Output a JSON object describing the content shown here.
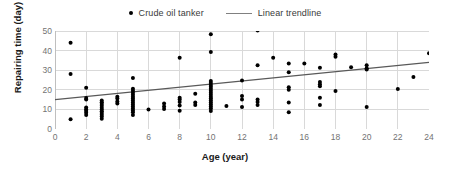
{
  "chart_data": {
    "type": "scatter",
    "title": "",
    "xlabel": "Age (year)",
    "ylabel": "Repairing time (day)",
    "xlim": [
      0,
      24
    ],
    "ylim": [
      0,
      50
    ],
    "xticks": [
      0,
      2,
      4,
      6,
      8,
      10,
      12,
      14,
      16,
      18,
      20,
      22,
      24
    ],
    "yticks": [
      0,
      10,
      20,
      30,
      40,
      50
    ],
    "grid": true,
    "legend_position": "top-center",
    "colors": {
      "marker": "#000000",
      "trendline": "#595959",
      "grid": "#d9d9d9",
      "tick_text": "#737373",
      "axis_title": "#1a1a1a"
    },
    "series": [
      {
        "name": "Crude oil tanker",
        "type": "scatter",
        "marker": "circle",
        "color": "#000000",
        "points": [
          [
            1,
            44.0
          ],
          [
            1,
            28.0
          ],
          [
            1,
            5.0
          ],
          [
            2,
            21.0
          ],
          [
            2,
            15.8
          ],
          [
            2,
            15.0
          ],
          [
            2,
            11.0
          ],
          [
            2,
            10.0
          ],
          [
            2,
            9.2
          ],
          [
            2,
            8.3
          ],
          [
            2,
            7.2
          ],
          [
            3,
            14.5
          ],
          [
            3,
            13.6
          ],
          [
            3,
            12.7
          ],
          [
            3,
            11.8
          ],
          [
            3,
            10.9
          ],
          [
            3,
            10.0
          ],
          [
            3,
            9.1
          ],
          [
            3,
            8.2
          ],
          [
            3,
            7.3
          ],
          [
            3,
            6.4
          ],
          [
            3,
            5.2
          ],
          [
            4,
            16.5
          ],
          [
            4,
            15.5
          ],
          [
            4,
            14.0
          ],
          [
            4,
            13.0
          ],
          [
            5,
            26.0
          ],
          [
            5,
            20.5
          ],
          [
            5,
            19.5
          ],
          [
            5,
            18.5
          ],
          [
            5,
            17.5
          ],
          [
            5,
            16.5
          ],
          [
            5,
            15.5
          ],
          [
            5,
            14.5
          ],
          [
            5,
            13.5
          ],
          [
            5,
            12.5
          ],
          [
            5,
            11.5
          ],
          [
            5,
            10.5
          ],
          [
            5,
            9.5
          ],
          [
            5,
            8.5
          ],
          [
            5,
            7.2
          ],
          [
            6,
            10.0
          ],
          [
            7,
            13.0
          ],
          [
            7,
            11.5
          ],
          [
            7,
            10.2
          ],
          [
            8,
            36.3
          ],
          [
            8,
            16.0
          ],
          [
            8,
            15.0
          ],
          [
            8,
            13.8
          ],
          [
            8,
            12.0
          ],
          [
            8,
            9.3
          ],
          [
            9,
            18.0
          ],
          [
            9,
            13.5
          ],
          [
            9,
            12.2
          ],
          [
            10,
            48.3
          ],
          [
            10,
            39.3
          ],
          [
            10,
            24.5
          ],
          [
            10,
            23.5
          ],
          [
            10,
            22.5
          ],
          [
            10,
            21.5
          ],
          [
            10,
            20.5
          ],
          [
            10,
            19.5
          ],
          [
            10,
            18.5
          ],
          [
            10,
            17.5
          ],
          [
            10,
            16.5
          ],
          [
            10,
            15.5
          ],
          [
            10,
            14.5
          ],
          [
            10,
            13.5
          ],
          [
            10,
            12.5
          ],
          [
            10,
            11.5
          ],
          [
            10,
            10.5
          ],
          [
            10,
            9.2
          ],
          [
            11,
            11.7
          ],
          [
            12,
            24.8
          ],
          [
            12,
            16.8
          ],
          [
            12,
            15.0
          ],
          [
            12,
            11.2
          ],
          [
            13,
            50.3
          ],
          [
            13,
            32.5
          ],
          [
            13,
            15.0
          ],
          [
            13,
            13.8
          ],
          [
            13,
            12.3
          ],
          [
            14,
            36.4
          ],
          [
            15,
            33.4
          ],
          [
            15,
            29.0
          ],
          [
            15,
            21.3
          ],
          [
            15,
            20.0
          ],
          [
            15,
            13.5
          ],
          [
            15,
            8.5
          ],
          [
            16,
            33.4
          ],
          [
            17,
            31.3
          ],
          [
            17,
            24.0
          ],
          [
            17,
            22.8
          ],
          [
            17,
            21.8
          ],
          [
            17,
            16.0
          ],
          [
            17,
            12.2
          ],
          [
            18,
            38.0
          ],
          [
            18,
            36.8
          ],
          [
            18,
            19.4
          ],
          [
            19,
            31.5
          ],
          [
            20,
            32.5
          ],
          [
            20,
            31.0
          ],
          [
            20,
            30.3
          ],
          [
            20,
            11.2
          ],
          [
            22,
            20.4
          ],
          [
            23,
            26.5
          ],
          [
            24,
            38.6
          ]
        ]
      },
      {
        "name": "Linear trendline",
        "type": "line",
        "color": "#595959",
        "x_start": 0,
        "y_start": 15.0,
        "x_end": 24,
        "y_end": 34.0
      }
    ],
    "legend": [
      {
        "label": "Crude oil tanker",
        "marker": "dot",
        "color": "#000000"
      },
      {
        "label": "Linear trendline",
        "marker": "line",
        "color": "#808080"
      }
    ]
  }
}
